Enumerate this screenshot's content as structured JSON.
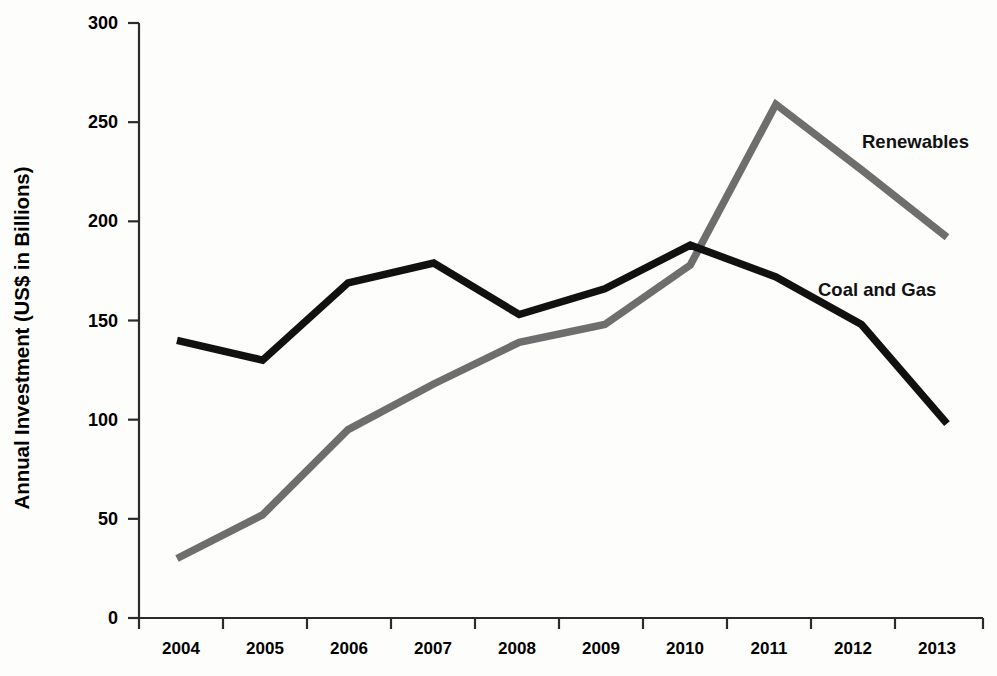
{
  "chart_data": {
    "type": "line",
    "title": "",
    "xlabel": "",
    "ylabel": "Annual Investment (US$ in Billions)",
    "categories": [
      "2004",
      "2005",
      "2006",
      "2007",
      "2008",
      "2009",
      "2010",
      "2011",
      "2012",
      "2013"
    ],
    "x": [
      2004,
      2005,
      2006,
      2007,
      2008,
      2009,
      2010,
      2011,
      2012,
      2013
    ],
    "ylim": [
      0,
      300
    ],
    "yticks": [
      0,
      50,
      100,
      150,
      200,
      250,
      300
    ],
    "ytick_labels": [
      "0",
      "50",
      "100",
      "150",
      "200",
      "250",
      "300"
    ],
    "grid": false,
    "legend_position": "inline-end-labels",
    "series": [
      {
        "name": "Renewables",
        "color": "#6e6e6e",
        "values": [
          30,
          52,
          95,
          118,
          139,
          148,
          178,
          259,
          226,
          192
        ]
      },
      {
        "name": "Coal and Gas",
        "color": "#111111",
        "values": [
          140,
          130,
          169,
          179,
          153,
          166,
          188,
          172,
          148,
          98
        ]
      }
    ],
    "annotations": [
      {
        "text": "Renewables",
        "series": "Renewables"
      },
      {
        "text": "Coal and Gas",
        "series": "Coal and Gas"
      }
    ]
  },
  "axes": {
    "y_title": "Annual Investment (US$ in Billions)",
    "y_labels": [
      "300",
      "250",
      "200",
      "150",
      "100",
      "50",
      "0"
    ],
    "x_labels": [
      "2004",
      "2005",
      "2006",
      "2007",
      "2008",
      "2009",
      "2010",
      "2011",
      "2012",
      "2013"
    ]
  },
  "labels": {
    "renewables": "Renewables",
    "coal_and_gas": "Coal and Gas"
  },
  "colors": {
    "renewables": "#6e6e6e",
    "coal_and_gas": "#111111",
    "axis": "#2b2b2b",
    "background": "#fdfdfc"
  }
}
